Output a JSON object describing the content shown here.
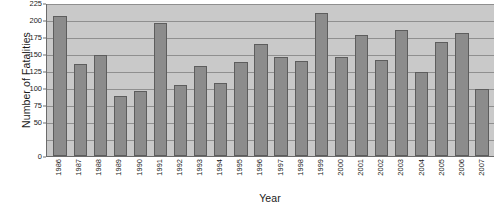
{
  "chart_data": {
    "type": "bar",
    "title": "",
    "xlabel": "Year",
    "ylabel": "Number of Fatalities",
    "ylim": [
      0,
      225
    ],
    "grid": true,
    "legend": "none",
    "categories": [
      "1986",
      "1987",
      "1988",
      "1989",
      "1990",
      "1991",
      "1992",
      "1993",
      "1994",
      "1995",
      "1996",
      "1997",
      "1998",
      "1999",
      "2000",
      "2001",
      "2002",
      "2003",
      "2004",
      "2005",
      "2006",
      "2007"
    ],
    "values": [
      206,
      136,
      148,
      88,
      95,
      196,
      104,
      133,
      107,
      138,
      165,
      145,
      139,
      211,
      145,
      178,
      141,
      186,
      124,
      168,
      181,
      99
    ],
    "y_ticks": [
      0,
      50,
      75,
      100,
      125,
      150,
      175,
      200,
      225
    ],
    "y_tick_labels": [
      "0",
      "50",
      "75",
      "100",
      "125",
      "150",
      "175",
      "200",
      "225"
    ],
    "gridline_values": [
      25,
      50,
      75,
      100,
      125,
      150,
      175,
      200,
      225
    ],
    "series_name": "Fatalities"
  },
  "colors": {
    "bar_fill": "#8c8c8c",
    "bar_border": "#5d5d5d",
    "plot_background": "#c9c9c9",
    "gridline": "#8f8f8f",
    "axis_line": "#6b6b6b",
    "text": "#1a1a1a",
    "page_background": "#ffffff"
  }
}
